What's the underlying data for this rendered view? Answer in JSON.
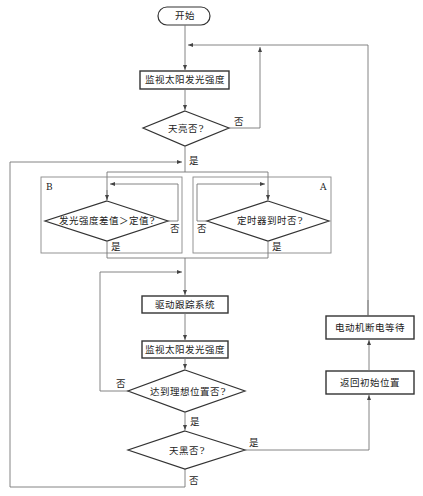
{
  "diagram": {
    "type": "flowchart",
    "start": "开始",
    "nodes": {
      "monitor1": "监视太阳发光强度",
      "is_day": "天亮否?",
      "diff_check": "发光强度差值＞定值?",
      "timer_check": "定时器到时否?",
      "drive": "驱动跟踪系统",
      "monitor2": "监视太阳发光强度",
      "reached": "达到理想位置否?",
      "is_night": "天黑否?",
      "motor_off": "电动机断电等待",
      "return_home": "返回初始位置"
    },
    "groups": {
      "b": "B",
      "a": "A"
    },
    "edge_labels": {
      "is_day_no": "否",
      "is_day_yes": "是",
      "diff_no": "否",
      "diff_yes": "是",
      "timer_no": "否",
      "timer_yes": "是",
      "reached_no": "否",
      "reached_yes": "是",
      "night_yes": "是",
      "night_no": "否"
    },
    "colors": {
      "stroke": "#333333",
      "thin_line": "#777777",
      "background": "#ffffff"
    }
  }
}
